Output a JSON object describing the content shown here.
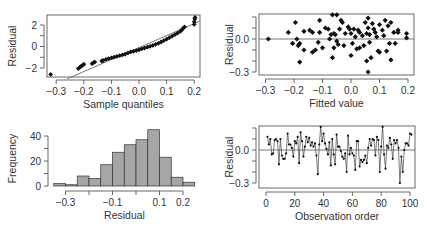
{
  "chart_data": [
    {
      "id": "qq",
      "type": "scatter",
      "title": "",
      "xlabel": "Sample quantiles",
      "ylabel": "Residual",
      "xlim": [
        -0.33,
        0.22
      ],
      "ylim": [
        -3.0,
        2.9
      ],
      "xticks": [
        -0.3,
        -0.2,
        -0.1,
        0.0,
        0.1,
        0.2
      ],
      "xtick_labels": [
        "−0.3",
        "−0.2",
        "−0.1",
        "0.0",
        "0.1",
        "0.2"
      ],
      "yticks": [
        -2,
        -1,
        0,
        1,
        2
      ],
      "ytick_labels": [
        "−2",
        "",
        "0",
        "",
        "2"
      ],
      "reference_line": {
        "x0": -0.26,
        "y0": -3.0,
        "x1": 0.22,
        "y1": 2.35
      },
      "points": [
        [
          -0.32,
          -2.6
        ],
        [
          -0.22,
          -2.05
        ],
        [
          -0.215,
          -1.95
        ],
        [
          -0.21,
          -1.85
        ],
        [
          -0.205,
          -1.75
        ],
        [
          -0.2,
          -1.65
        ],
        [
          -0.17,
          -1.6
        ],
        [
          -0.165,
          -1.5
        ],
        [
          -0.16,
          -1.45
        ],
        [
          -0.135,
          -1.35
        ],
        [
          -0.13,
          -1.3
        ],
        [
          -0.12,
          -1.2
        ],
        [
          -0.11,
          -1.12
        ],
        [
          -0.1,
          -1.05
        ],
        [
          -0.09,
          -0.98
        ],
        [
          -0.08,
          -0.92
        ],
        [
          -0.07,
          -0.85
        ],
        [
          -0.06,
          -0.78
        ],
        [
          -0.05,
          -0.7
        ],
        [
          -0.04,
          -0.6
        ],
        [
          -0.03,
          -0.5
        ],
        [
          -0.02,
          -0.45
        ],
        [
          -0.01,
          -0.38
        ],
        [
          0.0,
          -0.3
        ],
        [
          0.01,
          -0.22
        ],
        [
          0.02,
          -0.14
        ],
        [
          0.03,
          -0.06
        ],
        [
          0.04,
          0.02
        ],
        [
          0.05,
          0.1
        ],
        [
          0.06,
          0.2
        ],
        [
          0.07,
          0.3
        ],
        [
          0.08,
          0.42
        ],
        [
          0.09,
          0.55
        ],
        [
          0.1,
          0.68
        ],
        [
          0.11,
          0.82
        ],
        [
          0.12,
          0.96
        ],
        [
          0.13,
          1.1
        ],
        [
          0.14,
          1.25
        ],
        [
          0.15,
          1.42
        ],
        [
          0.155,
          1.55
        ],
        [
          0.16,
          1.7
        ],
        [
          0.165,
          1.82
        ],
        [
          0.2,
          2.05
        ],
        [
          0.2,
          2.3
        ],
        [
          0.202,
          2.55
        ],
        [
          0.203,
          2.7
        ]
      ]
    },
    {
      "id": "fitted",
      "type": "scatter",
      "title": "",
      "xlabel": "Fitted value",
      "ylabel": "Residual",
      "xlim": [
        -0.32,
        0.22
      ],
      "ylim": [
        -0.33,
        0.24
      ],
      "xticks": [
        -0.3,
        -0.2,
        -0.1,
        0.0,
        0.1,
        0.2
      ],
      "xtick_labels": [
        "−0.3",
        "−0.2",
        "−0.1",
        "0.0",
        "0.1",
        "0.2"
      ],
      "yticks": [
        -0.3,
        -0.2,
        -0.1,
        0.0,
        0.1,
        0.2
      ],
      "ytick_labels": [
        "−0.3",
        "",
        "",
        "0.0",
        "",
        ""
      ],
      "hline": 0.0,
      "points": [
        [
          -0.29,
          0.0
        ],
        [
          -0.22,
          0.06
        ],
        [
          -0.205,
          -0.04
        ],
        [
          -0.195,
          0.15
        ],
        [
          -0.19,
          0.0
        ],
        [
          -0.185,
          -0.06
        ],
        [
          -0.18,
          -0.04
        ],
        [
          -0.18,
          -0.21
        ],
        [
          -0.165,
          -0.1
        ],
        [
          -0.165,
          0.07
        ],
        [
          -0.145,
          0.08
        ],
        [
          -0.135,
          0.06
        ],
        [
          -0.135,
          -0.12
        ],
        [
          -0.125,
          -0.1
        ],
        [
          -0.115,
          -0.03
        ],
        [
          -0.11,
          0.06
        ],
        [
          -0.11,
          0.17
        ],
        [
          -0.09,
          0.1
        ],
        [
          -0.08,
          0.09
        ],
        [
          -0.075,
          0.0
        ],
        [
          -0.07,
          0.04
        ],
        [
          -0.065,
          0.22
        ],
        [
          -0.065,
          -0.17
        ],
        [
          -0.06,
          -0.08
        ],
        [
          -0.055,
          0.04
        ],
        [
          -0.05,
          0.22
        ],
        [
          -0.05,
          -0.02
        ],
        [
          -0.045,
          -0.05
        ],
        [
          -0.04,
          0.09
        ],
        [
          -0.035,
          0.17
        ],
        [
          -0.03,
          0.15
        ],
        [
          -0.025,
          -0.06
        ],
        [
          -0.02,
          0.05
        ],
        [
          -0.01,
          0.11
        ],
        [
          -0.005,
          0.09
        ],
        [
          0.0,
          0.05
        ],
        [
          0.0,
          -0.15
        ],
        [
          0.005,
          -0.04
        ],
        [
          0.01,
          0.09
        ],
        [
          0.015,
          0.02
        ],
        [
          0.02,
          -0.09
        ],
        [
          0.025,
          0.08
        ],
        [
          0.03,
          0.06
        ],
        [
          0.04,
          0.03
        ],
        [
          0.045,
          -0.06
        ],
        [
          0.05,
          0.15
        ],
        [
          0.055,
          0.05
        ],
        [
          0.055,
          -0.2
        ],
        [
          0.06,
          0.19
        ],
        [
          0.06,
          0.1
        ],
        [
          0.065,
          0.04
        ],
        [
          0.065,
          -0.03
        ],
        [
          0.07,
          -0.17
        ],
        [
          0.075,
          0.14
        ],
        [
          0.08,
          0.09
        ],
        [
          0.085,
          0.06
        ],
        [
          0.09,
          0.02
        ],
        [
          0.095,
          -0.11
        ],
        [
          0.1,
          0.13
        ],
        [
          0.1,
          -0.12
        ],
        [
          0.11,
          0.08
        ],
        [
          0.115,
          0.03
        ],
        [
          0.12,
          0.17
        ],
        [
          0.125,
          -0.11
        ],
        [
          0.13,
          0.12
        ],
        [
          0.135,
          -0.04
        ],
        [
          0.14,
          0.15
        ],
        [
          0.14,
          -0.19
        ],
        [
          0.15,
          0.06
        ],
        [
          0.155,
          -0.04
        ],
        [
          0.165,
          0.08
        ],
        [
          0.165,
          0.06
        ],
        [
          0.195,
          0.05
        ],
        [
          0.195,
          0.01
        ],
        [
          0.06,
          -0.3
        ],
        [
          -0.06,
          0.05
        ],
        [
          -0.1,
          -0.08
        ],
        [
          0.03,
          -0.08
        ]
      ]
    },
    {
      "id": "histogram",
      "type": "bar",
      "title": "",
      "xlabel": "Residual",
      "ylabel": "Frequency",
      "xlim": [
        -0.35,
        0.25
      ],
      "ylim": [
        0,
        45
      ],
      "xticks": [
        -0.3,
        -0.2,
        -0.1,
        0.0,
        0.1,
        0.2
      ],
      "xtick_labels": [
        "−0.3",
        "",
        "−0.1",
        "",
        "0.1",
        "0.2"
      ],
      "yticks": [
        0,
        10,
        20,
        30,
        40
      ],
      "ytick_labels": [
        "0",
        "",
        "20",
        "",
        "40"
      ],
      "bin_edges": [
        -0.35,
        -0.3,
        -0.25,
        -0.2,
        -0.15,
        -0.1,
        -0.05,
        0.0,
        0.05,
        0.1,
        0.15,
        0.2,
        0.25
      ],
      "values": [
        2,
        1,
        8,
        6,
        17,
        27,
        33,
        37,
        45,
        23,
        7,
        3
      ],
      "bar_color": "#a6a6a6"
    },
    {
      "id": "order",
      "type": "line",
      "title": "",
      "xlabel": "Observation order",
      "ylabel": "Residual",
      "xlim": [
        -3,
        104
      ],
      "ylim": [
        -0.33,
        0.24
      ],
      "xticks": [
        0,
        20,
        40,
        60,
        80,
        100
      ],
      "xtick_labels": [
        "0",
        "20",
        "40",
        "60",
        "80",
        "100"
      ],
      "yticks": [
        -0.3,
        -0.2,
        -0.1,
        0.0,
        0.1,
        0.2
      ],
      "ytick_labels": [
        "−0.3",
        "",
        "",
        "0.0",
        "",
        ""
      ],
      "hline": 0.0,
      "values": [
        0.12,
        0.05,
        0.1,
        -0.04,
        -0.03,
        0.09,
        0.1,
        0.08,
        -0.13,
        0.1,
        -0.05,
        -0.08,
        -0.08,
        -0.03,
        0.15,
        0.05,
        0.05,
        0.02,
        -0.06,
        0.08,
        0.06,
        0.12,
        -0.12,
        0.16,
        0.08,
        -0.06,
        0.03,
        0.12,
        0.07,
        0.11,
        0.04,
        0.07,
        0.03,
        0.06,
        -0.05,
        -0.22,
        0.05,
        0.21,
        0.08,
        0.15,
        0.06,
        0.01,
        -0.04,
        0.07,
        -0.14,
        0.1,
        -0.04,
        -0.13,
        0.14,
        0.03,
        0.03,
        -0.01,
        -0.06,
        -0.08,
        -0.03,
        -0.2,
        0.13,
        -0.04,
        0.02,
        -0.03,
        -0.05,
        -0.18,
        0.08,
        0.08,
        -0.15,
        -0.09,
        -0.11,
        -0.09,
        -0.05,
        -0.12,
        0.02,
        0.1,
        0.04,
        0.1,
        0.09,
        -0.05,
        0.12,
        0.09,
        -0.2,
        0.03,
        0.21,
        -0.04,
        -0.17,
        0.04,
        0.02,
        0.11,
        0.05,
        -0.08,
        0.09,
        0.06,
        0.09,
        0.02,
        -0.3,
        -0.06,
        -0.2,
        0.0,
        0.06,
        0.06,
        0.04,
        0.15,
        0.14
      ]
    }
  ]
}
